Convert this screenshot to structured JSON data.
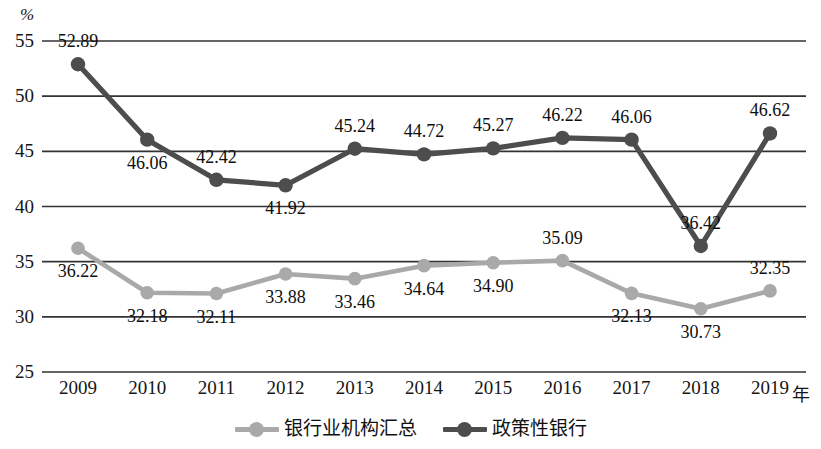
{
  "chart_data": {
    "type": "line",
    "title": "",
    "xlabel": "年",
    "ylabel": "%",
    "ylim": [
      25,
      55
    ],
    "yticks": [
      "25",
      "30",
      "35",
      "40",
      "45",
      "50",
      "55"
    ],
    "grid": true,
    "legend_position": "bottom",
    "categories": [
      "2009",
      "2010",
      "2011",
      "2012",
      "2013",
      "2014",
      "2015",
      "2016",
      "2017",
      "2018",
      "2019"
    ],
    "series": [
      {
        "name": "银行业机构汇总",
        "color": "#a9a9a9",
        "values": [
          36.22,
          32.18,
          32.11,
          33.88,
          33.46,
          34.64,
          34.9,
          35.09,
          32.13,
          30.73,
          32.35
        ],
        "labels": [
          "36.22",
          "32.18",
          "32.11",
          "33.88",
          "33.46",
          "34.64",
          "34.90",
          "35.09",
          "32.13",
          "30.73",
          "32.35"
        ],
        "label_positions": [
          "below",
          "below",
          "below",
          "below",
          "below",
          "below",
          "below",
          "above",
          "below",
          "below",
          "above"
        ]
      },
      {
        "name": "政策性银行",
        "color": "#4d4d4d",
        "values": [
          52.89,
          46.06,
          42.42,
          41.92,
          45.24,
          44.72,
          45.27,
          46.22,
          46.06,
          36.42,
          46.62
        ],
        "labels": [
          "52.89",
          "46.06",
          "42.42",
          "41.92",
          "45.24",
          "44.72",
          "45.27",
          "46.22",
          "46.06",
          "36.42",
          "46.62"
        ],
        "label_positions": [
          "above",
          "below",
          "above",
          "below",
          "above",
          "above",
          "above",
          "above",
          "above",
          "above",
          "above"
        ]
      }
    ]
  },
  "axis": {
    "y_unit": "%",
    "x_unit": "年"
  },
  "colors": {
    "series_light": "#a9a9a9",
    "series_dark": "#4d4d4d",
    "gridline": "#333333",
    "text": "#111111"
  }
}
